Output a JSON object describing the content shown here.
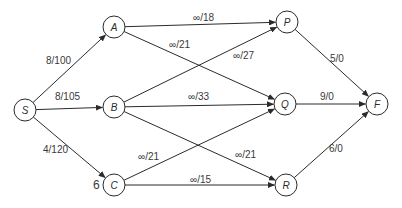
{
  "diagram": {
    "type": "flow-network",
    "colors": {
      "stroke": "#2b2b2b",
      "text": "#3a3a3a",
      "background": "#ffffff"
    },
    "node_radius": 11,
    "nodes": [
      {
        "id": "S",
        "label": "S",
        "x": 25,
        "y": 110
      },
      {
        "id": "A",
        "label": "A",
        "x": 114,
        "y": 27
      },
      {
        "id": "B",
        "label": "B",
        "x": 114,
        "y": 107
      },
      {
        "id": "C",
        "label": "C",
        "x": 114,
        "y": 185
      },
      {
        "id": "P",
        "label": "P",
        "x": 287,
        "y": 22
      },
      {
        "id": "Q",
        "label": "Q",
        "x": 285,
        "y": 104
      },
      {
        "id": "R",
        "label": "R",
        "x": 286,
        "y": 185
      },
      {
        "id": "F",
        "label": "F",
        "x": 377,
        "y": 104
      }
    ],
    "edges": [
      {
        "from": "S",
        "to": "A",
        "label": "8/100",
        "lx": 46,
        "ly": 64
      },
      {
        "from": "S",
        "to": "B",
        "label": "8/105",
        "lx": 55,
        "ly": 100
      },
      {
        "from": "S",
        "to": "C",
        "label": "4/120",
        "lx": 43,
        "ly": 153
      },
      {
        "from": "A",
        "to": "P",
        "label": "∞/18",
        "lx": 193,
        "ly": 21
      },
      {
        "from": "A",
        "to": "Q",
        "label": "∞/21",
        "lx": 169,
        "ly": 48
      },
      {
        "from": "B",
        "to": "P",
        "label": "∞/27",
        "lx": 233,
        "ly": 59
      },
      {
        "from": "B",
        "to": "Q",
        "label": "∞/33",
        "lx": 188,
        "ly": 100
      },
      {
        "from": "B",
        "to": "R",
        "label": "∞/21",
        "lx": 235,
        "ly": 158
      },
      {
        "from": "C",
        "to": "Q",
        "label": "∞/21",
        "lx": 138,
        "ly": 160
      },
      {
        "from": "C",
        "to": "R",
        "label": "∞/15",
        "lx": 190,
        "ly": 183
      },
      {
        "from": "P",
        "to": "F",
        "label": "5/0",
        "lx": 330,
        "ly": 62
      },
      {
        "from": "Q",
        "to": "F",
        "label": "9/0",
        "lx": 320,
        "ly": 100
      },
      {
        "from": "R",
        "to": "F",
        "label": "6/0",
        "lx": 329,
        "ly": 152
      }
    ],
    "annotations": [
      {
        "text": "6",
        "x": 93,
        "y": 189,
        "near": "C"
      }
    ]
  }
}
